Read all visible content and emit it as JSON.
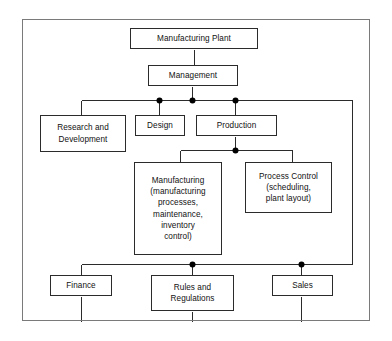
{
  "diagram": {
    "type": "org-tree",
    "stroke_color": "#2b2b2b",
    "frame_color": "#7a7a7a",
    "background": "#ffffff",
    "junction_color": "#000000",
    "nodes": [
      {
        "id": "manufacturing-plant",
        "label": "Manufacturing Plant",
        "x": 130,
        "y": 28,
        "w": 128,
        "h": 21
      },
      {
        "id": "management",
        "label": "Management",
        "x": 148,
        "y": 65,
        "w": 90,
        "h": 21
      },
      {
        "id": "research-and-development",
        "label": "Research and\nDevelopment",
        "x": 40,
        "y": 115,
        "w": 86,
        "h": 37
      },
      {
        "id": "design",
        "label": "Design",
        "x": 135,
        "y": 115,
        "w": 50,
        "h": 21
      },
      {
        "id": "production",
        "label": "Production",
        "x": 196,
        "y": 115,
        "w": 81,
        "h": 21
      },
      {
        "id": "manufacturing",
        "label": "Manufacturing\n(manufacturing\nprocesses,\nmaintenance,\ninventory\ncontrol)",
        "x": 134,
        "y": 162,
        "w": 88,
        "h": 93
      },
      {
        "id": "process-control",
        "label": "Process Control\n(scheduling,\nplant layout)",
        "x": 245,
        "y": 162,
        "w": 87,
        "h": 51
      },
      {
        "id": "finance",
        "label": "Finance",
        "x": 50,
        "y": 275,
        "w": 62,
        "h": 21
      },
      {
        "id": "rules-and-regulations",
        "label": "Rules and\nRegulations",
        "x": 151,
        "y": 275,
        "w": 83,
        "h": 36
      },
      {
        "id": "sales",
        "label": "Sales",
        "x": 272,
        "y": 275,
        "w": 61,
        "h": 21
      }
    ],
    "junction_dots": [
      {
        "id": "dot-design",
        "x": 159,
        "y": 100
      },
      {
        "id": "dot-management",
        "x": 192,
        "y": 100
      },
      {
        "id": "dot-production",
        "x": 235,
        "y": 100
      },
      {
        "id": "dot-production-split",
        "x": 235,
        "y": 150
      },
      {
        "id": "dot-rules",
        "x": 192,
        "y": 264
      },
      {
        "id": "dot-sales",
        "x": 301,
        "y": 264
      }
    ],
    "connectors": [
      {
        "id": "plant-to-management",
        "points": "194,49 194,65"
      },
      {
        "id": "management-to-bus",
        "points": "192,86 192,100"
      },
      {
        "id": "top-bus",
        "points": "81,100 352,100"
      },
      {
        "id": "bus-to-rnd",
        "points": "81,100 81,115"
      },
      {
        "id": "bus-to-design",
        "points": "159,100 159,115"
      },
      {
        "id": "bus-to-production",
        "points": "235,100 235,115"
      },
      {
        "id": "production-to-split",
        "points": "235,136 235,150"
      },
      {
        "id": "production-split-bus",
        "points": "180,150 292,150"
      },
      {
        "id": "split-to-manufacturing",
        "points": "180,150 180,162"
      },
      {
        "id": "split-to-process-control",
        "points": "292,150 292,162"
      },
      {
        "id": "right-riser",
        "points": "352,100 352,264"
      },
      {
        "id": "bottom-bus",
        "points": "81,264 352,264"
      },
      {
        "id": "bus-to-finance",
        "points": "81,264 81,275"
      },
      {
        "id": "bus-to-rules",
        "points": "192,264 192,275"
      },
      {
        "id": "bus-to-sales",
        "points": "301,264 301,275"
      },
      {
        "id": "finance-stub",
        "points": "81,296 81,321"
      },
      {
        "id": "rules-stub",
        "points": "192,311 192,321"
      },
      {
        "id": "sales-stub",
        "points": "301,296 301,321"
      }
    ]
  }
}
